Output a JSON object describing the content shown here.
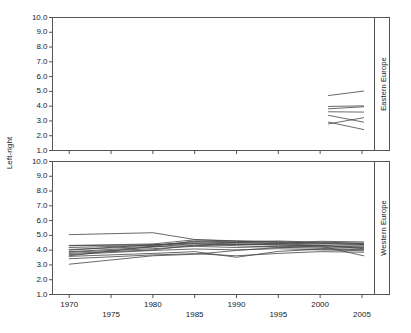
{
  "chart_data": {
    "type": "line",
    "title": "",
    "xlabel": "",
    "ylabel": "Left-right",
    "xlim": [
      1968.0,
      2006.5
    ],
    "ylim": [
      1.0,
      10.0
    ],
    "grid": false,
    "legend_position": "none",
    "x_ticks": [
      1970,
      1975,
      1980,
      1985,
      1990,
      1995,
      2000,
      2005
    ],
    "x_tick_labels": [
      "1970",
      "1975",
      "1980",
      "1985",
      "1990",
      "1995",
      "2000",
      "2005"
    ],
    "y_ticks": [
      1.0,
      2.0,
      3.0,
      4.0,
      5.0,
      6.0,
      7.0,
      8.0,
      9.0,
      10.0
    ],
    "y_tick_labels": [
      "1.0",
      "2.0",
      "3.0",
      "4.0",
      "5.0",
      "6.0",
      "7.0",
      "8.0",
      "9.0",
      "10.0"
    ],
    "line_color": "#444444",
    "panels": [
      {
        "name": "Eastern Europe",
        "label": "Eastern Europe",
        "series": [
          {
            "name": "ee-1",
            "x": [
              2001.0,
              2005.2
            ],
            "values": [
              4.72,
              5.02
            ]
          },
          {
            "name": "ee-2",
            "x": [
              2001.0,
              2005.2
            ],
            "values": [
              3.98,
              4.02
            ]
          },
          {
            "name": "ee-3",
            "x": [
              2001.0,
              2005.2
            ],
            "values": [
              3.82,
              3.96
            ]
          },
          {
            "name": "ee-4",
            "x": [
              2001.0,
              2005.2
            ],
            "values": [
              3.62,
              3.6
            ]
          },
          {
            "name": "ee-5",
            "x": [
              2001.0,
              2005.2
            ],
            "values": [
              3.38,
              2.92
            ]
          },
          {
            "name": "ee-6",
            "x": [
              2001.0,
              2005.2
            ],
            "values": [
              2.8,
              3.22
            ]
          },
          {
            "name": "ee-7",
            "x": [
              2001.0,
              2005.2
            ],
            "values": [
              2.92,
              2.42
            ]
          }
        ]
      },
      {
        "name": "Western Europe",
        "label": "Western Europe",
        "series": [
          {
            "name": "we-1",
            "x": [
              1970,
              1980,
              1985,
              1990,
              1995,
              2000,
              2005.2
            ],
            "values": [
              5.05,
              5.18,
              4.72,
              4.6,
              4.52,
              4.46,
              4.38
            ]
          },
          {
            "name": "we-2",
            "x": [
              1970,
              1980,
              1985,
              1990,
              1995,
              2000,
              2005.2
            ],
            "values": [
              4.32,
              4.42,
              4.7,
              4.64,
              4.58,
              4.5,
              4.44
            ]
          },
          {
            "name": "we-3",
            "x": [
              1970,
              1980,
              1985,
              1990,
              1995,
              2000,
              2005.2
            ],
            "values": [
              4.3,
              4.36,
              4.5,
              4.42,
              4.36,
              4.3,
              4.22
            ]
          },
          {
            "name": "we-4",
            "x": [
              1970,
              1980,
              1985,
              1990,
              1995,
              2000,
              2005.2
            ],
            "values": [
              4.18,
              4.32,
              4.58,
              4.5,
              4.44,
              4.6,
              4.56
            ]
          },
          {
            "name": "we-5",
            "x": [
              1970,
              1980,
              1985,
              1990,
              1995,
              2000,
              2005.2
            ],
            "values": [
              4.05,
              4.25,
              4.3,
              4.38,
              4.42,
              4.34,
              4.1
            ]
          },
          {
            "name": "we-6",
            "x": [
              1970,
              1980,
              1985,
              1990,
              1995,
              2000,
              2005.2
            ],
            "values": [
              4.0,
              4.38,
              4.42,
              4.3,
              4.2,
              4.12,
              4.02
            ]
          },
          {
            "name": "we-7",
            "x": [
              1970,
              1980,
              1985,
              1990,
              1995,
              2000,
              2005.2
            ],
            "values": [
              3.9,
              4.2,
              4.46,
              4.52,
              4.48,
              4.42,
              4.4
            ]
          },
          {
            "name": "we-8",
            "x": [
              1970,
              1980,
              1985,
              1990,
              1995,
              2000,
              2005.2
            ],
            "values": [
              3.86,
              4.1,
              4.26,
              4.18,
              4.26,
              4.2,
              4.18
            ]
          },
          {
            "name": "we-9",
            "x": [
              1970,
              1980,
              1985,
              1990,
              1995,
              2000,
              2005.2
            ],
            "values": [
              3.78,
              4.02,
              4.34,
              4.4,
              4.34,
              4.28,
              3.62
            ]
          },
          {
            "name": "we-10",
            "x": [
              1970,
              1980,
              1985,
              1990,
              1995,
              2000,
              2005.2
            ],
            "values": [
              3.7,
              3.98,
              4.08,
              4.02,
              4.1,
              4.02,
              3.96
            ]
          },
          {
            "name": "we-11",
            "x": [
              1970,
              1980,
              1985,
              1990,
              1995,
              2000,
              2005.2
            ],
            "values": [
              3.62,
              4.26,
              4.62,
              4.56,
              4.62,
              4.54,
              4.48
            ]
          },
          {
            "name": "we-12",
            "x": [
              1970,
              1980,
              1985,
              1990,
              1995,
              2000,
              2005.2
            ],
            "values": [
              3.58,
              3.78,
              3.9,
              3.52,
              3.92,
              4.06,
              4.08
            ]
          },
          {
            "name": "we-13",
            "x": [
              1970,
              1980,
              1985,
              1990,
              1995,
              2000,
              2005.2
            ],
            "values": [
              3.42,
              3.68,
              3.76,
              3.62,
              3.78,
              3.9,
              3.86
            ]
          },
          {
            "name": "we-14",
            "x": [
              1970,
              1980,
              1985,
              1990,
              1995,
              2000,
              2005.2
            ],
            "values": [
              3.05,
              3.62,
              3.72,
              3.98,
              4.18,
              4.28,
              4.3
            ]
          }
        ]
      }
    ]
  },
  "axis": {
    "ylabel": "Left-right"
  },
  "panel_labels": {
    "top": "Eastern Europe",
    "bottom": "Western Europe"
  }
}
